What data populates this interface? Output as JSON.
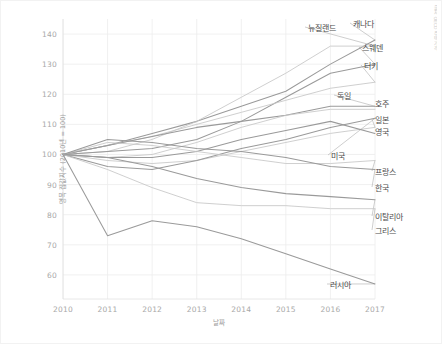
{
  "chart_data": {
    "type": "line",
    "title": "",
    "xlabel": "날짜",
    "ylabel": "명목 집값지수 (2010년 = 100)",
    "xlim": [
      2010,
      2017
    ],
    "ylim": [
      52,
      145
    ],
    "yticks": [
      140,
      130,
      120,
      110,
      100,
      90,
      80,
      70,
      60
    ],
    "x": [
      2010,
      2011,
      2012,
      2013,
      2014,
      2015,
      2016,
      2017
    ],
    "grid": true,
    "legend_position": "right-inline-labels",
    "series": [
      {
        "name": "캐나다",
        "values": [
          100,
          103,
          107,
          111,
          116,
          121,
          130,
          138
        ]
      },
      {
        "name": "뉴질랜드",
        "values": [
          100,
          101,
          105,
          111,
          119,
          127,
          136,
          136
        ]
      },
      {
        "name": "스웨덴",
        "values": [
          100,
          101,
          102,
          105,
          111,
          119,
          127,
          130
        ]
      },
      {
        "name": "터키",
        "values": [
          100,
          103,
          106,
          110,
          114,
          118,
          122,
          124
        ]
      },
      {
        "name": "독일",
        "values": [
          100,
          103,
          106,
          109,
          111,
          113,
          116,
          116
        ]
      },
      {
        "name": "호주",
        "values": [
          100,
          99,
          100,
          104,
          109,
          113,
          115,
          115
        ]
      },
      {
        "name": "일본",
        "values": [
          100,
          98,
          97,
          98,
          101,
          104,
          107,
          109
        ]
      },
      {
        "name": "영국",
        "values": [
          100,
          99,
          99,
          101,
          105,
          108,
          111,
          107
        ]
      },
      {
        "name": "미국",
        "values": [
          100,
          96,
          95,
          98,
          102,
          105,
          109,
          112
        ]
      },
      {
        "name": "프랑스",
        "values": [
          100,
          104,
          103,
          101,
          99,
          97,
          97,
          98
        ]
      },
      {
        "name": "한국",
        "values": [
          100,
          105,
          104,
          102,
          101,
          99,
          96,
          95
        ]
      },
      {
        "name": "이탈리아",
        "values": [
          100,
          99,
          96,
          92,
          89,
          87,
          86,
          85
        ]
      },
      {
        "name": "그리스",
        "values": [
          100,
          95,
          89,
          84,
          83,
          83,
          82,
          82
        ]
      },
      {
        "name": "러시아",
        "values": [
          100,
          73,
          78,
          76,
          72,
          67,
          62,
          57
        ]
      }
    ],
    "series_labels": [
      {
        "name": "캐나다",
        "x": 352,
        "y": 22,
        "anchor": "start"
      },
      {
        "name": "뉴질랜드",
        "x": 307,
        "y": 26,
        "anchor": "start"
      },
      {
        "name": "스웨덴",
        "x": 361,
        "y": 46,
        "anchor": "start"
      },
      {
        "name": "터키",
        "x": 363,
        "y": 64,
        "anchor": "start"
      },
      {
        "name": "독일",
        "x": 336,
        "y": 94,
        "anchor": "start"
      },
      {
        "name": "호주",
        "x": 374,
        "y": 102,
        "anchor": "start"
      },
      {
        "name": "일본",
        "x": 374,
        "y": 118,
        "anchor": "start"
      },
      {
        "name": "영국",
        "x": 374,
        "y": 130,
        "anchor": "start"
      },
      {
        "name": "미국",
        "x": 330,
        "y": 154,
        "anchor": "start"
      },
      {
        "name": "프랑스",
        "x": 374,
        "y": 170,
        "anchor": "start"
      },
      {
        "name": "한국",
        "x": 374,
        "y": 186,
        "anchor": "start"
      },
      {
        "name": "이탈리아",
        "x": 374,
        "y": 215,
        "anchor": "start"
      },
      {
        "name": "그리스",
        "x": 374,
        "y": 229,
        "anchor": "start"
      },
      {
        "name": "러시아",
        "x": 329,
        "y": 283,
        "anchor": "start"
      }
    ],
    "colors": {
      "line": "#9a9a9a",
      "line_light": "#c6c6c6",
      "grid": "#ececec",
      "tick_text": "#a8a8a8",
      "label_text": "#4c4c4c",
      "background": "#ffffff"
    }
  },
  "corner_note": "출처 OECD 주택가격"
}
